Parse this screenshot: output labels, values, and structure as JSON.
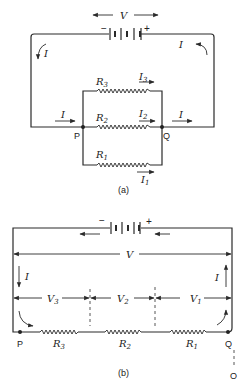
{
  "figure_a": {
    "caption": "(a)",
    "voltage_label": "V",
    "battery": {
      "minus": "−",
      "plus": "+"
    },
    "current_label": "I",
    "nodes": {
      "p": "P",
      "q": "Q"
    },
    "branches": [
      {
        "resistor": "R",
        "resistor_sub": "3",
        "current": "I",
        "current_sub": "3"
      },
      {
        "resistor": "R",
        "resistor_sub": "2",
        "current": "I",
        "current_sub": "2"
      },
      {
        "resistor": "R",
        "resistor_sub": "1",
        "current": "I",
        "current_sub": "1"
      }
    ]
  },
  "figure_b": {
    "caption": "(b)",
    "voltage_label": "V",
    "battery": {
      "minus": "−",
      "plus": "+"
    },
    "current_label": "I",
    "nodes": {
      "p": "P",
      "q": "Q",
      "o": "O"
    },
    "segments": [
      {
        "voltage": "V",
        "voltage_sub": "3",
        "resistor": "R",
        "resistor_sub": "3"
      },
      {
        "voltage": "V",
        "voltage_sub": "2",
        "resistor": "R",
        "resistor_sub": "2"
      },
      {
        "voltage": "V",
        "voltage_sub": "1",
        "resistor": "R",
        "resistor_sub": "1"
      }
    ]
  },
  "colors": {
    "ink": "#2a2a2a",
    "background": "#ffffff"
  }
}
